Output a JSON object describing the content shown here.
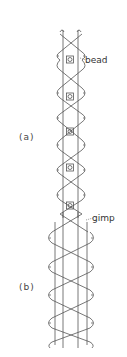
{
  "figure": {
    "annotations": {
      "bead": "bead",
      "gimp": "gimp"
    },
    "panels": {
      "a": "(a)",
      "b": "(b)"
    }
  },
  "colors": {
    "line": "#555555",
    "background": "#ffffff"
  }
}
